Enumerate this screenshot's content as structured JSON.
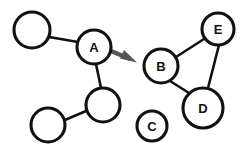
{
  "diagram": {
    "type": "node-link-graph",
    "title": "",
    "canvas": {
      "width": 248,
      "height": 151,
      "background": "#ffffff"
    },
    "style": {
      "node_fill": "#ffffff",
      "node_stroke": "#111111",
      "edge_stroke": "#111111",
      "label_color": "#111111",
      "arrow_color": "#555555"
    },
    "nodes": [
      {
        "id": "n1",
        "label": "",
        "cx": 32,
        "cy": 30,
        "r": 18,
        "labelled": false
      },
      {
        "id": "A",
        "label": "A",
        "cx": 94,
        "cy": 47,
        "r": 17,
        "labelled": true
      },
      {
        "id": "n2",
        "label": "",
        "cx": 103,
        "cy": 105,
        "r": 17,
        "labelled": false
      },
      {
        "id": "n3",
        "label": "",
        "cx": 48,
        "cy": 125,
        "r": 17,
        "labelled": false
      },
      {
        "id": "B",
        "label": "B",
        "cx": 161,
        "cy": 66,
        "r": 17,
        "labelled": true
      },
      {
        "id": "E",
        "label": "E",
        "cx": 218,
        "cy": 29,
        "r": 16,
        "labelled": true
      },
      {
        "id": "D",
        "label": "D",
        "cx": 203,
        "cy": 108,
        "r": 20,
        "labelled": true
      },
      {
        "id": "C",
        "label": "C",
        "cx": 152,
        "cy": 126,
        "r": 15,
        "labelled": true
      }
    ],
    "edges": [
      {
        "from": "n1",
        "to": "A",
        "x1": 49,
        "y1": 37,
        "x2": 78,
        "y2": 42
      },
      {
        "from": "A",
        "to": "n2",
        "x1": 96,
        "y1": 64,
        "x2": 101,
        "y2": 88
      },
      {
        "from": "n2",
        "to": "n3",
        "x1": 86,
        "y1": 111,
        "x2": 65,
        "y2": 120
      },
      {
        "from": "B",
        "to": "E",
        "x1": 176,
        "y1": 57,
        "x2": 204,
        "y2": 39
      },
      {
        "from": "B",
        "to": "D",
        "x1": 170,
        "y1": 81,
        "x2": 189,
        "y2": 93
      },
      {
        "from": "E",
        "to": "D",
        "x1": 219,
        "y1": 45,
        "x2": 208,
        "y2": 88
      }
    ],
    "arrows": [
      {
        "from": "A",
        "to": "B",
        "color": "#555555",
        "shaft": {
          "x1": 111,
          "y1": 51,
          "x2": 132,
          "y2": 60
        },
        "head": "136,62 121,58 124,51"
      }
    ],
    "isolated_nodes": [
      "C"
    ]
  }
}
